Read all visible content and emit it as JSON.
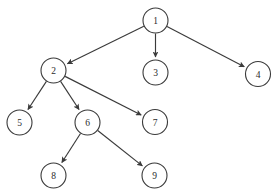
{
  "diagram": {
    "type": "directed-graph",
    "background_color": "#ffffff",
    "stroke_color": "#3a3a3a",
    "node_fill_color": "#ffffff",
    "label_color": "#2b2b2b",
    "node_radius": 12.5,
    "nodes": [
      {
        "id": "1",
        "label": "1",
        "cx": 155.5,
        "cy": 20.5
      },
      {
        "id": "2",
        "label": "2",
        "cx": 53.5,
        "cy": 70.5
      },
      {
        "id": "3",
        "label": "3",
        "cx": 155.5,
        "cy": 72.5
      },
      {
        "id": "4",
        "label": "4",
        "cx": 258.0,
        "cy": 74.0
      },
      {
        "id": "5",
        "label": "5",
        "cx": 19.5,
        "cy": 122.5
      },
      {
        "id": "6",
        "label": "6",
        "cx": 87.5,
        "cy": 122.5
      },
      {
        "id": "7",
        "label": "7",
        "cx": 155.0,
        "cy": 122.0
      },
      {
        "id": "8",
        "label": "8",
        "cx": 53.5,
        "cy": 175.5
      },
      {
        "id": "9",
        "label": "9",
        "cx": 154.5,
        "cy": 175.5
      }
    ],
    "edges": [
      {
        "from": "1",
        "to": "2",
        "directed": true
      },
      {
        "from": "1",
        "to": "3",
        "directed": true
      },
      {
        "from": "1",
        "to": "4",
        "directed": true
      },
      {
        "from": "2",
        "to": "5",
        "directed": true
      },
      {
        "from": "2",
        "to": "6",
        "directed": true
      },
      {
        "from": "2",
        "to": "7",
        "directed": true
      },
      {
        "from": "6",
        "to": "8",
        "directed": true
      },
      {
        "from": "6",
        "to": "9",
        "directed": true
      }
    ]
  }
}
